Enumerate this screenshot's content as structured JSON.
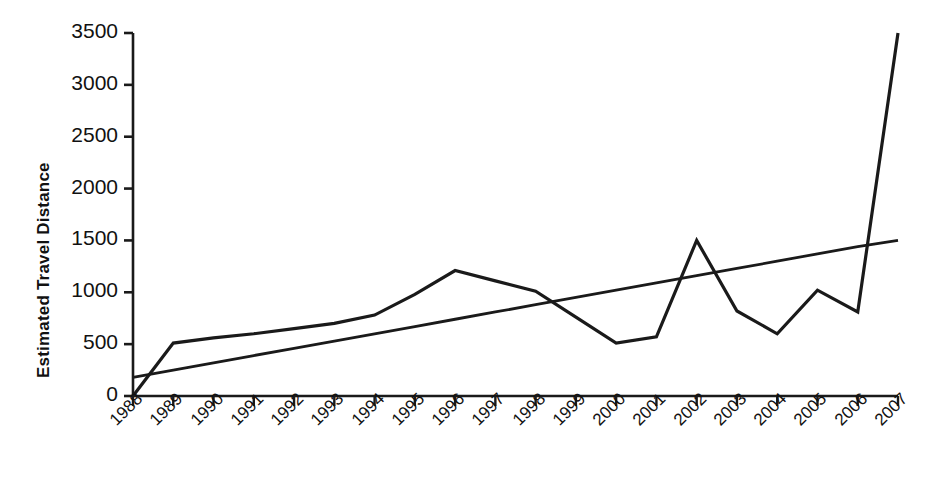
{
  "chart_data": {
    "type": "line",
    "title": "",
    "subtitle": "",
    "xlabel": "",
    "ylabel": "Estimated Travel Distance",
    "categories": [
      "1988",
      "1989",
      "1990",
      "1991",
      "1992",
      "1993",
      "1994",
      "1995",
      "1996",
      "1997",
      "1998",
      "1999",
      "2000",
      "2001",
      "2002",
      "2003",
      "2004",
      "2005",
      "2006",
      "2007"
    ],
    "x": [
      1988,
      1989,
      1990,
      1991,
      1992,
      1993,
      1994,
      1995,
      1996,
      1997,
      1998,
      1999,
      2000,
      2001,
      2002,
      2003,
      2004,
      2005,
      2006,
      2007
    ],
    "xlim": [
      1988,
      2007
    ],
    "ylim": [
      0,
      3500
    ],
    "yticks": [
      0,
      500,
      1000,
      1500,
      2000,
      2500,
      3000,
      3500
    ],
    "ytick_labels": [
      "0",
      "500",
      "1000",
      "1500",
      "2000",
      "2500",
      "3000",
      "3500"
    ],
    "grid": false,
    "legend": false,
    "legend_position": "none",
    "line_color": "#1a1a1a",
    "axis_color": "#1a1a1a",
    "background": "#ffffff",
    "series": [
      {
        "name": "Estimated Travel Distance",
        "type": "line",
        "values": [
          0,
          510,
          560,
          600,
          650,
          700,
          780,
          980,
          1210,
          1110,
          1010,
          760,
          510,
          570,
          1500,
          820,
          600,
          1020,
          810,
          3500
        ]
      },
      {
        "name": "Linear trend",
        "type": "line",
        "values": [
          180,
          250,
          320,
          390,
          460,
          530,
          600,
          670,
          740,
          810,
          880,
          950,
          1020,
          1090,
          1160,
          1230,
          1300,
          1370,
          1440,
          1500
        ]
      }
    ]
  },
  "axes": {
    "y_axis_title": "Estimated Travel Distance"
  }
}
